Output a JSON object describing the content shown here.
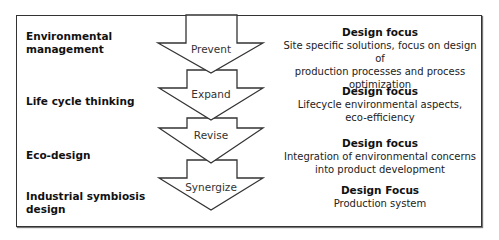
{
  "left_labels": [
    {
      "line1": "Environmental",
      "line2": "management"
    },
    {
      "line1": "Life cycle thinking",
      "line2": ""
    },
    {
      "line1": "Eco-design",
      "line2": ""
    },
    {
      "line1": "Industrial symbiosis",
      "line2": "design"
    }
  ],
  "arrows": [
    {
      "label": "Prevent"
    },
    {
      "label": "Expand"
    },
    {
      "label": "Revise"
    },
    {
      "label": "Synergize"
    }
  ],
  "focus": [
    {
      "heading": "Design focus",
      "lines": [
        "Site specific solutions, focus on design of",
        "production processes and process",
        "optimization"
      ]
    },
    {
      "heading": "Design focus",
      "lines": [
        "Lifecycle environmental aspects,",
        "eco-efficiency"
      ]
    },
    {
      "heading": "Design focus",
      "lines": [
        "Integration of environmental concerns",
        "into product development"
      ]
    },
    {
      "heading": "Design Focus",
      "lines": [
        "Production system"
      ]
    }
  ],
  "colors": {
    "stroke": "#333333",
    "fill": "#ffffff"
  }
}
